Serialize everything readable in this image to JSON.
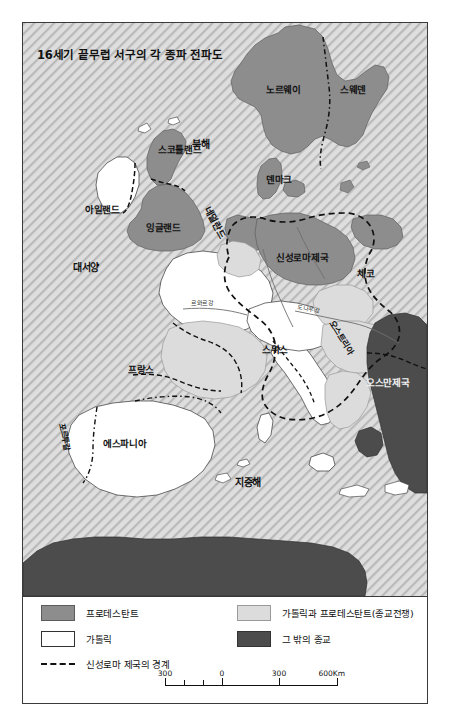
{
  "figure": {
    "title": "16세기 끝무렵 서구의 각 종파 전파도"
  },
  "map": {
    "labels": [
      {
        "id": "norway",
        "text": "노르웨이",
        "kind": "country"
      },
      {
        "id": "sweden",
        "text": "스웨덴",
        "kind": "country"
      },
      {
        "id": "northsea",
        "text": "북해",
        "kind": "sea"
      },
      {
        "id": "scotland",
        "text": "스코틀랜드",
        "kind": "country"
      },
      {
        "id": "ireland",
        "text": "아일랜드",
        "kind": "country"
      },
      {
        "id": "england",
        "text": "잉글랜드",
        "kind": "country"
      },
      {
        "id": "netherlands",
        "text": "네덜란드",
        "kind": "country"
      },
      {
        "id": "denmark",
        "text": "덴마크",
        "kind": "country"
      },
      {
        "id": "hre",
        "text": "신성로마제국",
        "kind": "country"
      },
      {
        "id": "czech",
        "text": "체코",
        "kind": "country"
      },
      {
        "id": "austria",
        "text": "오스트리아",
        "kind": "country"
      },
      {
        "id": "switzerland",
        "text": "스위스",
        "kind": "country"
      },
      {
        "id": "ottoman",
        "text": "오스만제국",
        "kind": "country"
      },
      {
        "id": "france",
        "text": "프랑스",
        "kind": "country"
      },
      {
        "id": "spain",
        "text": "에스파니아",
        "kind": "country"
      },
      {
        "id": "portugal",
        "text": "포르투갈",
        "kind": "country"
      },
      {
        "id": "atlantic",
        "text": "대서양",
        "kind": "sea"
      },
      {
        "id": "mediterranean",
        "text": "지중해",
        "kind": "sea"
      },
      {
        "id": "danube",
        "text": "도나우강",
        "kind": "river"
      },
      {
        "id": "loire",
        "text": "르와르강",
        "kind": "river"
      }
    ]
  },
  "legend": {
    "items": [
      {
        "id": "protestant",
        "label": "프로테스탄트",
        "swatch": "solid-medium-gray",
        "color": "#8d8d8d"
      },
      {
        "id": "catholic",
        "label": "가톨릭",
        "swatch": "solid-white",
        "color": "#ffffff"
      },
      {
        "id": "mixed",
        "label": "가톨릭과 프로테스탄트(종교전쟁)",
        "swatch": "solid-light-gray",
        "color": "#dcdcdc"
      },
      {
        "id": "other",
        "label": "그 밖의 종교",
        "swatch": "solid-dark-gray",
        "color": "#4c4c4c"
      },
      {
        "id": "hre-border",
        "label": "신성로마 제국의 경계",
        "swatch": "dashed-line",
        "color": "#111111"
      }
    ]
  },
  "scalebar": {
    "ticks": [
      "300",
      "0",
      "300",
      "600Km"
    ]
  },
  "colors": {
    "sea_hatch": "#d9d9d9",
    "protestant": "#8d8d8d",
    "catholic": "#ffffff",
    "mixed": "#dcdcdc",
    "other": "#4c4c4c",
    "frame": "#3a3a3a"
  }
}
